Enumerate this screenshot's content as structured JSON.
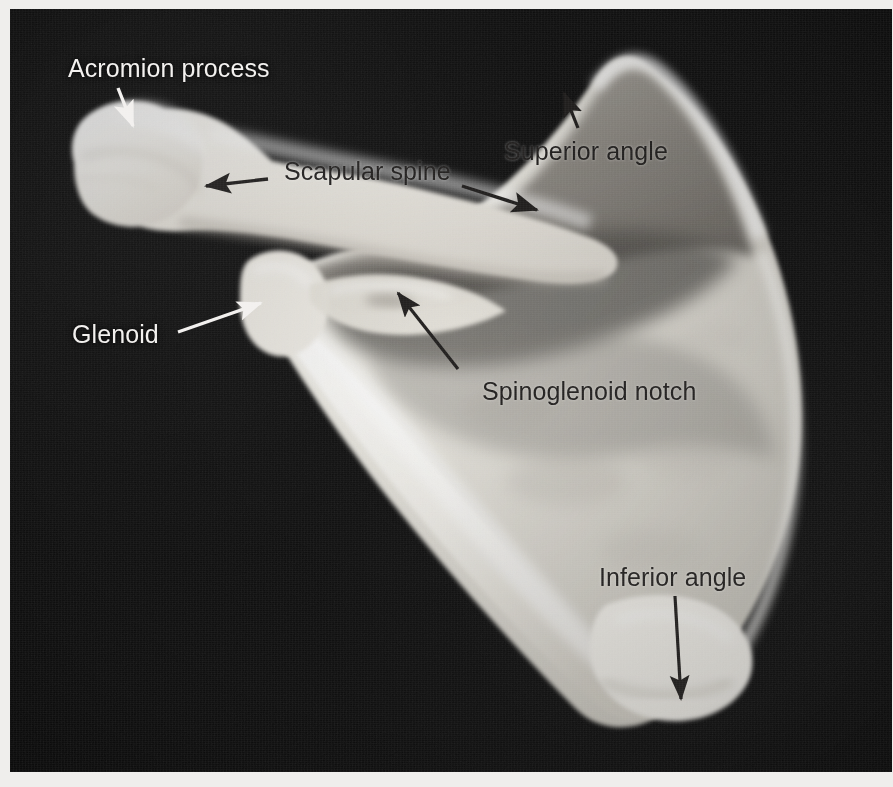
{
  "figure": {
    "plate_background_color": "#0a0a0a",
    "page_background_color": "#e9e9e7",
    "bone_color": "#f3f1ec"
  },
  "labels": [
    {
      "id": "acromion-process",
      "text": "Acromion process",
      "style": "light",
      "font_size_px": 25,
      "left_px": 68,
      "top_px": 54,
      "arrow": {
        "color": "#f2f0ee",
        "from": [
          118,
          88
        ],
        "to": [
          133,
          126
        ],
        "head": "filled"
      }
    },
    {
      "id": "scapular-spine",
      "text": "Scapular spine",
      "style": "dark",
      "font_size_px": 25,
      "left_px": 284,
      "top_px": 157,
      "arrow": {
        "color": "#201e1d",
        "from": [
          268,
          178
        ],
        "to": [
          205,
          186
        ],
        "head": "filled"
      },
      "arrow2": {
        "color": "#201e1d",
        "from": [
          462,
          186
        ],
        "to": [
          537,
          209
        ],
        "head": "filled"
      }
    },
    {
      "id": "superior-angle",
      "text": "Superior angle",
      "style": "dark",
      "font_size_px": 25,
      "left_px": 504,
      "top_px": 137,
      "arrow": {
        "color": "#201e1d",
        "from": [
          578,
          128
        ],
        "to": [
          563,
          92
        ],
        "head": "filled"
      }
    },
    {
      "id": "glenoid",
      "text": "Glenoid",
      "style": "light",
      "font_size_px": 25,
      "left_px": 72,
      "top_px": 320,
      "arrow": {
        "color": "#f2f0ee",
        "from": [
          178,
          331
        ],
        "to": [
          262,
          302
        ],
        "head": "filled"
      }
    },
    {
      "id": "spinoglenoid-notch",
      "text": "Spinoglenoid notch",
      "style": "dark",
      "font_size_px": 25,
      "left_px": 482,
      "top_px": 377,
      "arrow": {
        "color": "#201e1d",
        "from": [
          457,
          368
        ],
        "to": [
          397,
          292
        ],
        "head": "filled"
      }
    },
    {
      "id": "inferior-angle",
      "text": "Inferior angle",
      "style": "dark",
      "font_size_px": 25,
      "left_px": 599,
      "top_px": 563,
      "arrow": {
        "color": "#201e1d",
        "from": [
          675,
          596
        ],
        "to": [
          681,
          700
        ],
        "head": "filled"
      }
    }
  ]
}
